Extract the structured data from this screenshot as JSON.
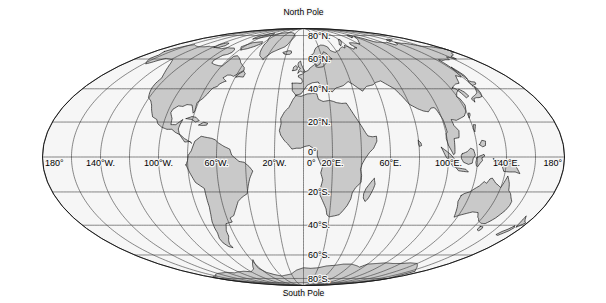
{
  "figure": {
    "kind": "world-map",
    "projection": "Mollweide elliptical equal-area world projection",
    "background_color": "#ffffff",
    "ocean_color": "#f6f6f6",
    "land_color": "#c9c9c9",
    "line_color": "#1a1a1a",
    "graticule_color": "#3a3a3a"
  },
  "pole_labels": {
    "north": "North Pole",
    "south": "South Pole"
  },
  "latitude_labels": [
    {
      "text": "80°N.",
      "value": 80
    },
    {
      "text": "60°N.",
      "value": 60
    },
    {
      "text": "40°N.",
      "value": 40
    },
    {
      "text": "20°N.",
      "value": 20
    },
    {
      "text": "0°",
      "value": 0
    },
    {
      "text": "20°S.",
      "value": -20
    },
    {
      "text": "40°S.",
      "value": -40
    },
    {
      "text": "60°S.",
      "value": -60
    },
    {
      "text": "80°S.",
      "value": -80
    }
  ],
  "longitude_labels": [
    {
      "text": "180°",
      "value": -180
    },
    {
      "text": "140°W.",
      "value": -140
    },
    {
      "text": "100°W.",
      "value": -100
    },
    {
      "text": "60°W.",
      "value": -60
    },
    {
      "text": "20°W.",
      "value": -20
    },
    {
      "text": "0°",
      "value": 0
    },
    {
      "text": "20°E.",
      "value": 20
    },
    {
      "text": "60°E.",
      "value": 60
    },
    {
      "text": "100°E.",
      "value": 100
    },
    {
      "text": "140°E.",
      "value": 140
    },
    {
      "text": "180°",
      "value": 180
    }
  ],
  "graticule": {
    "meridian_interval_deg": 20,
    "parallel_interval_deg": 20,
    "meridians": [
      -180,
      -160,
      -140,
      -120,
      -100,
      -80,
      -60,
      -40,
      -20,
      0,
      20,
      40,
      60,
      80,
      100,
      120,
      140,
      160,
      180
    ],
    "parallels": [
      -80,
      -60,
      -40,
      -20,
      0,
      20,
      40,
      60,
      80
    ]
  },
  "chart_data": {
    "type": "map",
    "title": "",
    "projection": "mollweide",
    "center_longitude": 0,
    "xlabel": "",
    "ylabel": "",
    "xlim": [
      -180,
      180
    ],
    "ylim": [
      -90,
      90
    ],
    "grid": true,
    "legend": "none",
    "annotations": [
      "North Pole",
      "South Pole"
    ]
  }
}
